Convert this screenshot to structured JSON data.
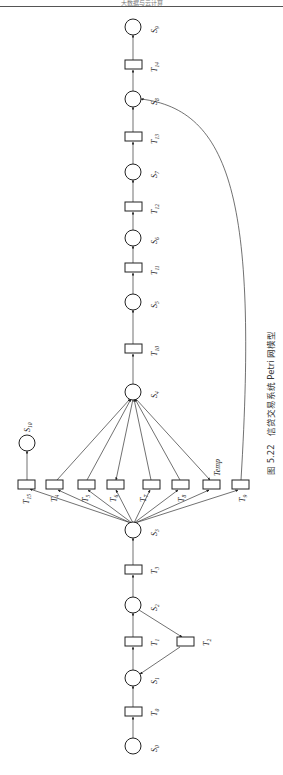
{
  "header": {
    "running_title": "大数据与云计算"
  },
  "figure": {
    "caption_number": "图 5.22",
    "caption_text": "信贷交易系统 Petri 网模型",
    "places": [
      {
        "id": "S0",
        "base": "S",
        "sub": "0"
      },
      {
        "id": "S1",
        "base": "S",
        "sub": "1"
      },
      {
        "id": "S2",
        "base": "S",
        "sub": "2"
      },
      {
        "id": "S3",
        "base": "S",
        "sub": "3"
      },
      {
        "id": "S4",
        "base": "S",
        "sub": "4"
      },
      {
        "id": "S5",
        "base": "S",
        "sub": "5"
      },
      {
        "id": "S6",
        "base": "S",
        "sub": "6"
      },
      {
        "id": "S7",
        "base": "S",
        "sub": "7"
      },
      {
        "id": "S8",
        "base": "S",
        "sub": "8"
      },
      {
        "id": "S9",
        "base": "S",
        "sub": "9"
      },
      {
        "id": "S10",
        "base": "S",
        "sub": "10"
      }
    ],
    "transitions": [
      {
        "id": "T0",
        "base": "T",
        "sub": "0"
      },
      {
        "id": "T1",
        "base": "T",
        "sub": "1"
      },
      {
        "id": "T2",
        "base": "T",
        "sub": "2"
      },
      {
        "id": "T3",
        "base": "T",
        "sub": "3"
      },
      {
        "id": "T4",
        "base": "T",
        "sub": "4"
      },
      {
        "id": "T5",
        "base": "T",
        "sub": "5"
      },
      {
        "id": "T6",
        "base": "T",
        "sub": "6"
      },
      {
        "id": "T7",
        "base": "T",
        "sub": "7"
      },
      {
        "id": "T8",
        "base": "T",
        "sub": "8"
      },
      {
        "id": "T9",
        "base": "T",
        "sub": "9"
      },
      {
        "id": "T10",
        "base": "T",
        "sub": "10"
      },
      {
        "id": "T11",
        "base": "T",
        "sub": "11"
      },
      {
        "id": "T12",
        "base": "T",
        "sub": "12"
      },
      {
        "id": "T13",
        "base": "T",
        "sub": "13"
      },
      {
        "id": "T14",
        "base": "T",
        "sub": "14"
      },
      {
        "id": "T15",
        "base": "T",
        "sub": "15"
      },
      {
        "id": "Temp",
        "base": "Temp",
        "sub": ""
      }
    ],
    "arcs": [
      [
        "S0",
        "T0"
      ],
      [
        "T0",
        "S1"
      ],
      [
        "S1",
        "T1"
      ],
      [
        "T1",
        "S2"
      ],
      [
        "S2",
        "T2"
      ],
      [
        "T2",
        "S1"
      ],
      [
        "S2",
        "T3"
      ],
      [
        "T3",
        "S3"
      ],
      [
        "S3",
        "T15"
      ],
      [
        "S3",
        "T4"
      ],
      [
        "S3",
        "T5"
      ],
      [
        "S3",
        "T6"
      ],
      [
        "S3",
        "T7"
      ],
      [
        "S3",
        "T8"
      ],
      [
        "S3",
        "Temp"
      ],
      [
        "S3",
        "T9"
      ],
      [
        "T15",
        "S10"
      ],
      [
        "T4",
        "S4"
      ],
      [
        "T5",
        "S4"
      ],
      [
        "S4",
        "T6"
      ],
      [
        "T7",
        "S4"
      ],
      [
        "T8",
        "S4"
      ],
      [
        "S4",
        "Temp"
      ],
      [
        "T9",
        "S8"
      ],
      [
        "S4",
        "T10"
      ],
      [
        "T10",
        "S5"
      ],
      [
        "S5",
        "T11"
      ],
      [
        "T11",
        "S6"
      ],
      [
        "S6",
        "T12"
      ],
      [
        "T12",
        "S7"
      ],
      [
        "S7",
        "T13"
      ],
      [
        "T13",
        "S8"
      ],
      [
        "S8",
        "T14"
      ],
      [
        "T14",
        "S9"
      ]
    ]
  }
}
